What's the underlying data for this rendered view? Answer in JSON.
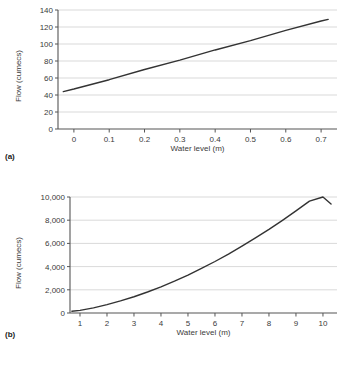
{
  "figures": [
    {
      "panel": "(a)",
      "xlabel": "Water level (m)",
      "ylabel": "Flow (cumecs)"
    },
    {
      "panel": "(b)",
      "xlabel": "Water level (m)",
      "ylabel": "Flow (cumecs)"
    }
  ],
  "chart_data": [
    {
      "type": "line",
      "title": "",
      "panel": "(a)",
      "xlabel": "Water level (m)",
      "ylabel": "Flow (cumecs)",
      "xlim": [
        -0.045,
        0.745
      ],
      "ylim": [
        0,
        140
      ],
      "xticks": [
        0,
        0.1,
        0.2,
        0.3,
        0.4,
        0.5,
        0.6,
        0.7
      ],
      "xticklabels": [
        "0",
        "0.1",
        "0.2",
        "0.3",
        "0.4",
        "0.5",
        "0.6",
        "0.7"
      ],
      "yticks": [
        0,
        20,
        40,
        60,
        80,
        100,
        120,
        140
      ],
      "yticklabels": [
        "0",
        "20",
        "40",
        "60",
        "80",
        "100",
        "120",
        "140"
      ],
      "grid": "horizontal",
      "legend": "none",
      "series": [
        {
          "name": "rating curve",
          "color": "#333333",
          "x": [
            -0.03,
            0.0,
            0.1,
            0.2,
            0.3,
            0.4,
            0.5,
            0.6,
            0.7,
            0.72
          ],
          "y": [
            44,
            47,
            58,
            70,
            81,
            93,
            104,
            116,
            127,
            129
          ]
        }
      ]
    },
    {
      "type": "line",
      "title": "",
      "panel": "(b)",
      "xlabel": "Water level (m)",
      "ylabel": "Flow (cumecs)",
      "xlim": [
        0.63,
        10.52
      ],
      "ylim": [
        0,
        10000
      ],
      "xticks": [
        1,
        2,
        3,
        4,
        5,
        6,
        7,
        8,
        9,
        10
      ],
      "xticklabels": [
        "1",
        "2",
        "3",
        "4",
        "5",
        "6",
        "7",
        "8",
        "9",
        "10"
      ],
      "yticks": [
        0,
        2000,
        4000,
        6000,
        8000,
        10000
      ],
      "yticklabels": [
        "0",
        "2,000",
        "4,000",
        "6,000",
        "8,000",
        "10,000"
      ],
      "grid": "horizontal",
      "legend": "none",
      "series": [
        {
          "name": "rating curve",
          "color": "#333333",
          "x": [
            0.7,
            1.0,
            1.5,
            2.0,
            2.5,
            3.0,
            3.5,
            4.0,
            4.5,
            5.0,
            5.5,
            6.0,
            6.5,
            7.0,
            7.5,
            8.0,
            8.5,
            9.0,
            9.5,
            10.0,
            10.3
          ],
          "y": [
            150,
            230,
            440,
            720,
            1040,
            1400,
            1810,
            2250,
            2740,
            3270,
            3840,
            4440,
            5080,
            5760,
            6470,
            7210,
            7990,
            8800,
            9640,
            10500,
            9400
          ]
        }
      ]
    }
  ]
}
